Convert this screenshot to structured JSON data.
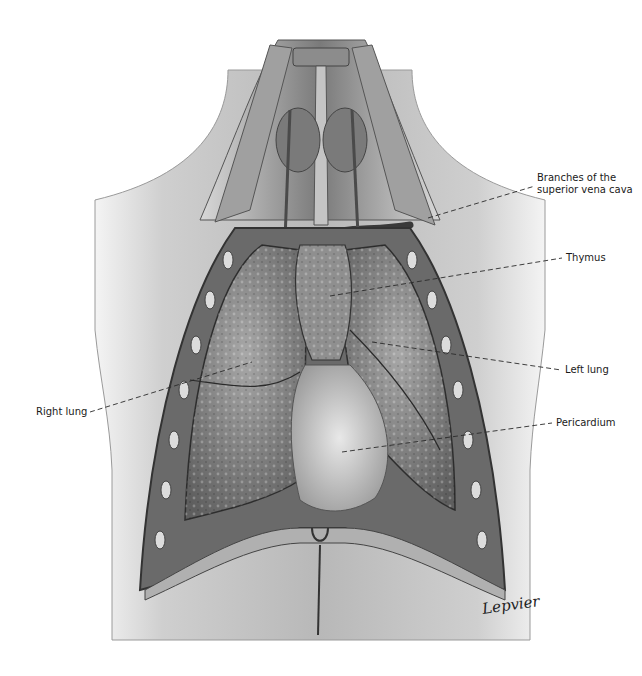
{
  "figure": {
    "signature": "Lepvier",
    "labels": [
      {
        "id": "branches",
        "text_line1": "Branches of the",
        "text_line2": "superior vena cava",
        "side": "right"
      },
      {
        "id": "thymus",
        "text": "Thymus",
        "side": "right"
      },
      {
        "id": "left_lung",
        "text": "Left lung",
        "side": "right"
      },
      {
        "id": "pericardium",
        "text": "Pericardium",
        "side": "right"
      },
      {
        "id": "right_lung",
        "text": "Right lung",
        "side": "left"
      }
    ],
    "colors": {
      "background": "#ffffff",
      "skin_light": "#e6e6e6",
      "skin_mid": "#bdbdbd",
      "tissue_dark": "#6e6e6e",
      "lung": "#8a8a8a",
      "pericardium": "#d4d4d4",
      "leader_line": "#333333",
      "label_text": "#1a1a1a"
    }
  }
}
